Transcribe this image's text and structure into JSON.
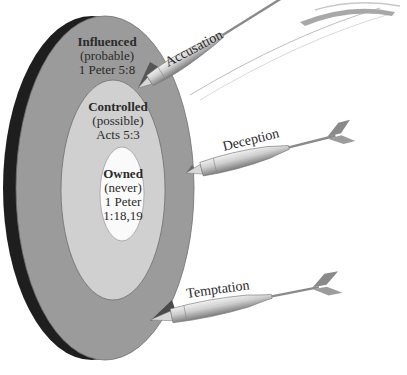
{
  "diagram": {
    "type": "target-with-darts",
    "colors": {
      "rim": "#1e1e1e",
      "outer_ring": "#9b9b9b",
      "middle_ring": "#d0d0d0",
      "inner_ring": "#fafafa",
      "dart_body": "#c4c4c4",
      "dart_shade": "#6a6a6a",
      "text": "#2a2a2a"
    },
    "rings": [
      {
        "id": "outer",
        "title": "Influenced",
        "likelihood": "(probable)",
        "reference": "1 Peter 5:8"
      },
      {
        "id": "middle",
        "title": "Controlled",
        "likelihood": "(possible)",
        "reference": "Acts 5:3"
      },
      {
        "id": "inner",
        "title": "Owned",
        "likelihood": "(never)",
        "reference_line1": "1 Peter",
        "reference_line2": "1:18,19"
      }
    ],
    "darts": [
      {
        "id": "accusation",
        "label": "Accusation"
      },
      {
        "id": "deception",
        "label": "Deception"
      },
      {
        "id": "temptation",
        "label": "Temptation"
      }
    ]
  }
}
